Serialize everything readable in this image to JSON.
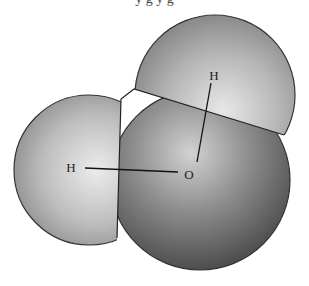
{
  "diagram": {
    "title_fragment": "y   g                                    y  g",
    "molecule": "water",
    "atoms": [
      {
        "id": "H1",
        "label": "H",
        "x": 71,
        "y": 167
      },
      {
        "id": "H2",
        "label": "H",
        "x": 214,
        "y": 76
      },
      {
        "id": "O",
        "label": "O",
        "x": 189,
        "y": 175
      }
    ],
    "bonds": [
      {
        "from": "H1",
        "to": "O"
      },
      {
        "from": "H2",
        "to": "O"
      }
    ],
    "colors": {
      "hydrogen_light": "#e6e6e6",
      "hydrogen_dark": "#8a8a8a",
      "oxygen_light": "#cfcfcf",
      "oxygen_dark": "#3c3c3c",
      "outline": "#333333"
    }
  }
}
